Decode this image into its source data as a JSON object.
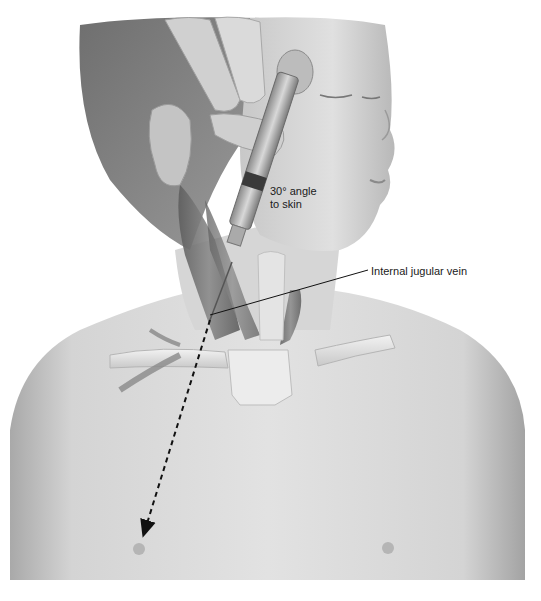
{
  "figure": {
    "style": "grayscale anatomical illustration",
    "labels": {
      "angle": "30° angle to skin",
      "angle_line1": "30° angle",
      "angle_line2": "to skin",
      "vein": "Internal jugular vein"
    },
    "annotations": {
      "needle_angle_degrees": 30,
      "dashed_arrow_direction": "toward ipsilateral nipple"
    },
    "colors": {
      "background": "#ffffff",
      "skin_light": "#d9d9d9",
      "skin_mid": "#bdbdbd",
      "skin_dark": "#8f8f8f",
      "hair": "#7a7a7a",
      "muscle": "#6e6e6e",
      "vessel": "#e6e6e6",
      "label_text": "#1a1a1a",
      "leader_line": "#111111"
    }
  }
}
